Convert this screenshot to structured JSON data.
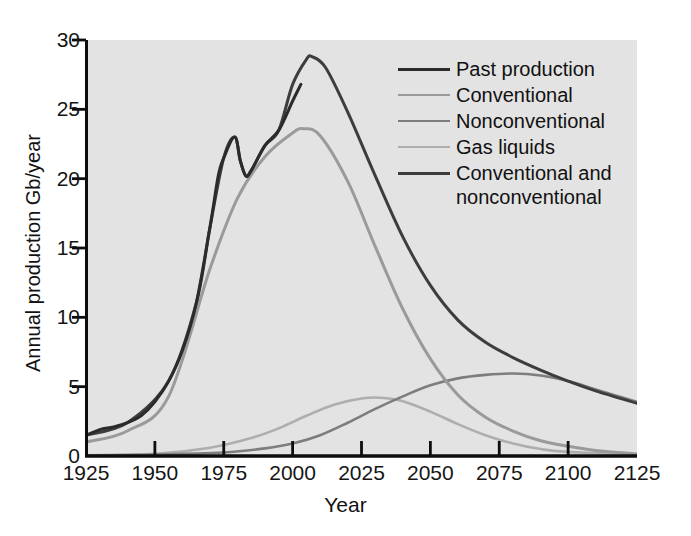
{
  "chart_data": {
    "type": "line",
    "title": "",
    "xlabel": "Year",
    "ylabel": "Annual production Gb/year",
    "xlim": [
      1925,
      2125
    ],
    "ylim": [
      0,
      30
    ],
    "xticks": [
      1925,
      1950,
      1975,
      2000,
      2025,
      2050,
      2075,
      2100,
      2125
    ],
    "yticks": [
      0,
      5,
      10,
      15,
      20,
      25,
      30
    ],
    "grid": false,
    "legend_position": "top-right",
    "plot_background": "#e3e3e3",
    "series": [
      {
        "name": "Past production",
        "color": "#2b2b2b",
        "width": 3.0,
        "x": [
          1925,
          1930,
          1935,
          1940,
          1945,
          1950,
          1955,
          1960,
          1965,
          1970,
          1973,
          1975,
          1979,
          1981,
          1983,
          1985,
          1990,
          1995,
          2000,
          2003
        ],
        "y": [
          1.5,
          1.9,
          2.1,
          2.4,
          2.9,
          3.9,
          5.4,
          7.6,
          11.0,
          16.5,
          20.2,
          21.5,
          23.0,
          21.3,
          20.2,
          20.6,
          22.4,
          23.5,
          25.6,
          26.8
        ]
      },
      {
        "name": "Conventional",
        "color": "#9a9a9a",
        "width": 3.0,
        "x": [
          1925,
          1940,
          1955,
          1970,
          1980,
          1990,
          2000,
          2004,
          2010,
          2020,
          2030,
          2040,
          2050,
          2060,
          2070,
          2080,
          2090,
          2100,
          2110,
          2125
        ],
        "y": [
          1.0,
          1.8,
          4.3,
          13.5,
          18.6,
          21.6,
          23.3,
          23.6,
          23.1,
          19.8,
          15.1,
          10.6,
          7.0,
          4.4,
          2.8,
          1.8,
          1.1,
          0.7,
          0.4,
          0.15
        ]
      },
      {
        "name": "Nonconventional",
        "color": "#7d7d7d",
        "width": 2.6,
        "x": [
          1925,
          1950,
          1975,
          1990,
          2000,
          2010,
          2020,
          2030,
          2040,
          2050,
          2060,
          2070,
          2080,
          2090,
          2100,
          2110,
          2125
        ],
        "y": [
          0.05,
          0.1,
          0.25,
          0.55,
          0.9,
          1.5,
          2.4,
          3.4,
          4.3,
          5.1,
          5.6,
          5.85,
          5.95,
          5.8,
          5.4,
          4.8,
          3.9
        ]
      },
      {
        "name": "Gas liquids",
        "color": "#aeaeae",
        "width": 2.6,
        "x": [
          1925,
          1950,
          1970,
          1985,
          1995,
          2005,
          2015,
          2025,
          2032,
          2040,
          2050,
          2060,
          2070,
          2080,
          2090,
          2100,
          2125
        ],
        "y": [
          0.05,
          0.15,
          0.6,
          1.3,
          2.0,
          2.9,
          3.7,
          4.15,
          4.2,
          3.95,
          3.2,
          2.3,
          1.5,
          0.9,
          0.5,
          0.3,
          0.1
        ]
      },
      {
        "name": "Conventional and nonconventional",
        "color": "#3d3d3d",
        "width": 3.0,
        "x": [
          1925,
          1940,
          1955,
          1965,
          1970,
          1975,
          1979,
          1981,
          1983,
          1985,
          1990,
          1995,
          2000,
          2005,
          2007,
          2012,
          2020,
          2030,
          2040,
          2050,
          2060,
          2070,
          2080,
          2090,
          2100,
          2110,
          2125
        ],
        "y": [
          1.5,
          2.4,
          5.4,
          11.0,
          16.5,
          21.5,
          23.0,
          21.3,
          20.2,
          20.6,
          22.4,
          23.5,
          26.8,
          28.6,
          28.8,
          28.0,
          24.8,
          20.2,
          15.8,
          12.3,
          9.8,
          8.2,
          7.1,
          6.2,
          5.4,
          4.7,
          3.8
        ]
      }
    ]
  },
  "axes": {
    "y_title": "Annual production Gb/year",
    "x_title": "Year",
    "y_tick_labels": [
      "30",
      "25",
      "20",
      "15",
      "10",
      "5",
      "0"
    ],
    "x_tick_labels": [
      "1925",
      "1950",
      "1975",
      "2000",
      "2025",
      "2050",
      "2075",
      "2100",
      "2125"
    ]
  },
  "legend": {
    "items": [
      {
        "label": "Past production",
        "color": "#2b2b2b",
        "width": "3.2px"
      },
      {
        "label": "Conventional",
        "color": "#9a9a9a",
        "width": "2.6px"
      },
      {
        "label": "Nonconventional",
        "color": "#7d7d7d",
        "width": "2.6px"
      },
      {
        "label": "Gas liquids",
        "color": "#aeaeae",
        "width": "2.4px"
      },
      {
        "label": "Conventional and nonconventional",
        "color": "#3d3d3d",
        "width": "3.0px"
      }
    ]
  }
}
